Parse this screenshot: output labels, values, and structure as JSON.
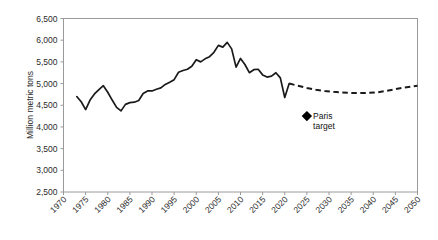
{
  "chart_data": {
    "type": "line",
    "title": "",
    "subtitle": "",
    "xlabel": "",
    "ylabel": "Million metric tons",
    "xlim": [
      1970,
      2050
    ],
    "ylim": [
      2500,
      6500
    ],
    "grid": false,
    "legend_position": "none",
    "x_ticks": [
      "1970",
      "1975",
      "1980",
      "1985",
      "1990",
      "1995",
      "2000",
      "2005",
      "2010",
      "2015",
      "2020",
      "2025",
      "2030",
      "2035",
      "2040",
      "2045",
      "2050"
    ],
    "y_ticks": [
      "2,500",
      "3,000",
      "3,500",
      "4,000",
      "4,500",
      "5,000",
      "5,500",
      "6,000",
      "6,500"
    ],
    "series": [
      {
        "name": "historical",
        "style": "solid",
        "x": [
          1973,
          1974,
          1975,
          1976,
          1977,
          1978,
          1979,
          1980,
          1981,
          1982,
          1983,
          1984,
          1985,
          1986,
          1987,
          1988,
          1989,
          1990,
          1991,
          1992,
          1993,
          1994,
          1995,
          1996,
          1997,
          1998,
          1999,
          2000,
          2001,
          2002,
          2003,
          2004,
          2005,
          2006,
          2007,
          2008,
          2009,
          2010,
          2011,
          2012,
          2013,
          2014,
          2015,
          2016,
          2017,
          2018,
          2019,
          2020,
          2021
        ],
        "values": [
          4700,
          4580,
          4400,
          4620,
          4760,
          4860,
          4950,
          4800,
          4620,
          4450,
          4370,
          4520,
          4560,
          4570,
          4610,
          4770,
          4830,
          4830,
          4870,
          4900,
          4980,
          5030,
          5090,
          5260,
          5300,
          5330,
          5400,
          5550,
          5500,
          5570,
          5620,
          5720,
          5880,
          5840,
          5950,
          5800,
          5380,
          5580,
          5440,
          5250,
          5320,
          5330,
          5200,
          5150,
          5170,
          5250,
          5130,
          4680,
          5000
        ]
      },
      {
        "name": "projection",
        "style": "dashed",
        "x": [
          2021,
          2023,
          2025,
          2027,
          2029,
          2031,
          2033,
          2035,
          2037,
          2039,
          2041,
          2043,
          2045,
          2047,
          2050
        ],
        "values": [
          5000,
          4950,
          4900,
          4860,
          4830,
          4810,
          4795,
          4785,
          4780,
          4785,
          4800,
          4830,
          4870,
          4910,
          4950
        ]
      }
    ],
    "annotations": [
      {
        "name": "paris-target",
        "label_line1": "Paris",
        "label_line2": "target",
        "marker": "diamond",
        "x": 2025,
        "y": 4250
      }
    ]
  }
}
